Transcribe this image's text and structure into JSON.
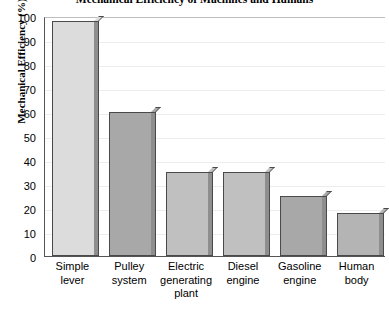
{
  "chart_data": {
    "type": "bar",
    "title": "Mechanical Efficiency of Machines and Humans",
    "xlabel": "",
    "ylabel": "Mechanical Efficiency (%)",
    "ylim": [
      0,
      100
    ],
    "ytick_interval": 10,
    "ytick_labels": [
      "100",
      "90",
      "80",
      "70",
      "60",
      "50",
      "40",
      "30",
      "20",
      "10",
      "0"
    ],
    "grid": true,
    "legend": "none",
    "categories": [
      "Simple lever",
      "Pulley system",
      "Electric generating plant",
      "Diesel engine",
      "Gasoline engine",
      "Human body"
    ],
    "category_lines": [
      [
        "Simple",
        "lever"
      ],
      [
        "Pulley",
        "system"
      ],
      [
        "Electric",
        "generating",
        "plant"
      ],
      [
        "Diesel",
        "engine"
      ],
      [
        "Gasoline",
        "engine"
      ],
      [
        "Human",
        "body"
      ]
    ],
    "values": [
      98,
      60,
      35,
      35,
      25,
      18
    ],
    "bar_colors": [
      "#dcdcdc",
      "#a8a8a8",
      "#c0c0c0",
      "#c0c0c0",
      "#a8a8a8",
      "#b4b4b4"
    ],
    "colors": {
      "background": "#ffffff",
      "axis": "#555555",
      "gridline": "#ededed",
      "bar_outline": "#4a4a4a",
      "bar_side": "#8e8e8e",
      "text": "#000000"
    }
  }
}
